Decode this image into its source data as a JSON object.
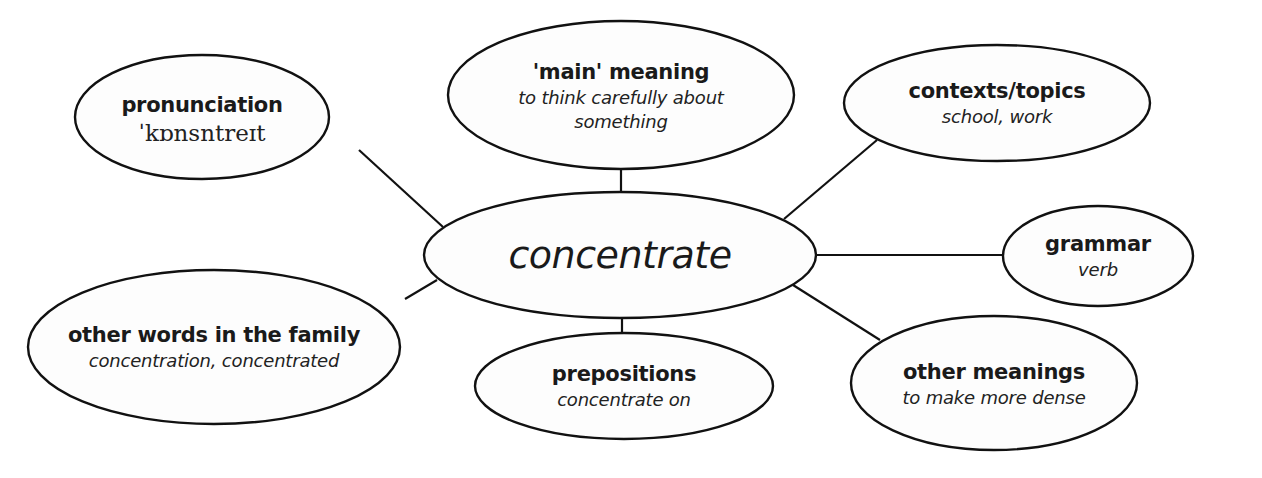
{
  "diagram": {
    "type": "word mind map",
    "center": {
      "label": "concentrate"
    },
    "nodes": [
      {
        "id": "pronunciation",
        "title": "pronunciation",
        "detail": "ˈkɒnsntreɪt"
      },
      {
        "id": "main-meaning",
        "title": "'main' meaning",
        "detail_line1": "to think carefully about",
        "detail_line2": "something"
      },
      {
        "id": "contexts",
        "title": "contexts/topics",
        "detail": "school, work"
      },
      {
        "id": "grammar",
        "title": "grammar",
        "detail": "verb"
      },
      {
        "id": "other-words",
        "title": "other words in the family",
        "detail": "concentration, concentrated"
      },
      {
        "id": "prepositions",
        "title": "prepositions",
        "detail": "concentrate on"
      },
      {
        "id": "other-meanings",
        "title": "other meanings",
        "detail": "to make more dense"
      }
    ],
    "colors": {
      "stroke": "#111111",
      "fill": "#fdfdfd",
      "text": "#1a1a1a"
    }
  }
}
